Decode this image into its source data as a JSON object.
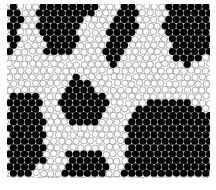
{
  "figure": {
    "type": "particle-packing-diagram",
    "colors": {
      "filled": "#000000",
      "empty_fill": "#ffffff",
      "empty_stroke": "#8a8a8a",
      "background": "#ffffff"
    },
    "frame": {
      "x": 7,
      "y": 4,
      "width": 203,
      "height": 174
    },
    "disk_diameter": 7.4,
    "black_regions": [
      {
        "name": "left-top-strip",
        "polygon": [
          [
            7,
            4
          ],
          [
            14,
            4
          ],
          [
            22,
            20
          ],
          [
            14,
            52
          ],
          [
            7,
            52
          ]
        ]
      },
      {
        "name": "top-left-trapezoid",
        "polygon": [
          [
            40,
            4
          ],
          [
            98,
            4
          ],
          [
            86,
            20
          ],
          [
            70,
            52
          ],
          [
            46,
            52
          ],
          [
            36,
            24
          ]
        ]
      },
      {
        "name": "top-center-strip",
        "polygon": [
          [
            118,
            6
          ],
          [
            134,
            6
          ],
          [
            140,
            16
          ],
          [
            124,
            56
          ],
          [
            112,
            66
          ],
          [
            104,
            52
          ],
          [
            110,
            30
          ]
        ]
      },
      {
        "name": "top-right-block",
        "polygon": [
          [
            168,
            4
          ],
          [
            210,
            4
          ],
          [
            210,
            56
          ],
          [
            196,
            62
          ],
          [
            186,
            66
          ],
          [
            172,
            60
          ],
          [
            164,
            22
          ]
        ]
      },
      {
        "name": "center-triangle",
        "polygon": [
          [
            78,
            74
          ],
          [
            112,
            102
          ],
          [
            94,
            128
          ],
          [
            66,
            124
          ],
          [
            58,
            104
          ]
        ]
      },
      {
        "name": "left-bottom-block",
        "polygon": [
          [
            7,
            92
          ],
          [
            38,
            96
          ],
          [
            44,
            120
          ],
          [
            44,
            160
          ],
          [
            26,
            178
          ],
          [
            7,
            178
          ]
        ]
      },
      {
        "name": "bottom-center",
        "polygon": [
          [
            66,
            152
          ],
          [
            102,
            154
          ],
          [
            108,
            168
          ],
          [
            108,
            178
          ],
          [
            64,
            178
          ]
        ]
      },
      {
        "name": "bottom-right-block",
        "polygon": [
          [
            140,
            104
          ],
          [
            170,
            98
          ],
          [
            200,
            106
          ],
          [
            210,
            116
          ],
          [
            210,
            178
          ],
          [
            124,
            178
          ],
          [
            126,
            128
          ]
        ]
      }
    ]
  },
  "caption": {
    "text": "Figure 3.4  Crystal regions in a simulated packing"
  }
}
